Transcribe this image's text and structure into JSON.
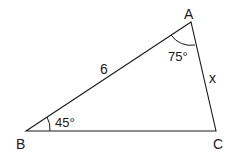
{
  "diagram": {
    "type": "triangle",
    "vertices": {
      "A": {
        "label": "A",
        "x": 191,
        "y": 22
      },
      "B": {
        "label": "B",
        "x": 26,
        "y": 131
      },
      "C": {
        "label": "C",
        "x": 216,
        "y": 131
      }
    },
    "sides": {
      "AB": {
        "label": "6"
      },
      "AC": {
        "label": "x"
      }
    },
    "angles": {
      "A": {
        "label": "75°"
      },
      "B": {
        "label": "45°"
      }
    },
    "colors": {
      "stroke": "#1a1a1a",
      "background": "#ffffff"
    }
  }
}
